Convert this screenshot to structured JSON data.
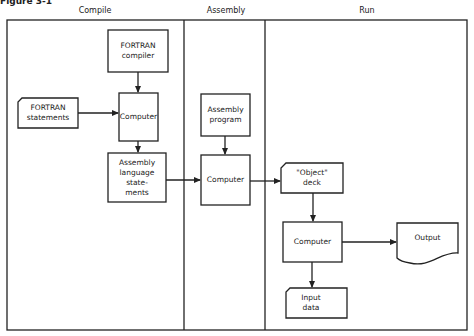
{
  "figure": {
    "label": "Figure 3-1"
  },
  "columns": [
    {
      "id": "compile",
      "label": "Compile"
    },
    {
      "id": "assembly",
      "label": "Assembly"
    },
    {
      "id": "run",
      "label": "Run"
    }
  ],
  "nodes": {
    "fortran_compiler": {
      "label": "FORTRAN\ncompiler",
      "shape": "process"
    },
    "fortran_statements": {
      "label": "FORTRAN\nstatements",
      "shape": "card"
    },
    "compile_computer": {
      "label": "Computer",
      "shape": "process"
    },
    "assembly_language_statements": {
      "label": "Assembly\nlanguage\nstate-\nments",
      "shape": "process"
    },
    "assembly_program": {
      "label": "Assembly\nprogram",
      "shape": "process"
    },
    "assembly_computer": {
      "label": "Computer",
      "shape": "process"
    },
    "object_deck": {
      "label": "\"Object\"\ndeck",
      "shape": "card"
    },
    "run_computer": {
      "label": "Computer",
      "shape": "process"
    },
    "output": {
      "label": "Output",
      "shape": "document"
    },
    "input_data": {
      "label": "Input\ndata",
      "shape": "card"
    }
  },
  "edges": [
    {
      "from": "fortran_compiler",
      "to": "compile_computer"
    },
    {
      "from": "fortran_statements",
      "to": "compile_computer"
    },
    {
      "from": "compile_computer",
      "to": "assembly_language_statements"
    },
    {
      "from": "assembly_language_statements",
      "to": "assembly_computer"
    },
    {
      "from": "assembly_program",
      "to": "assembly_computer"
    },
    {
      "from": "assembly_computer",
      "to": "object_deck"
    },
    {
      "from": "object_deck",
      "to": "run_computer"
    },
    {
      "from": "run_computer",
      "to": "output"
    },
    {
      "from": "run_computer",
      "to": "input_data"
    }
  ],
  "colors": {
    "line": "#222222",
    "background": "#ffffff"
  }
}
